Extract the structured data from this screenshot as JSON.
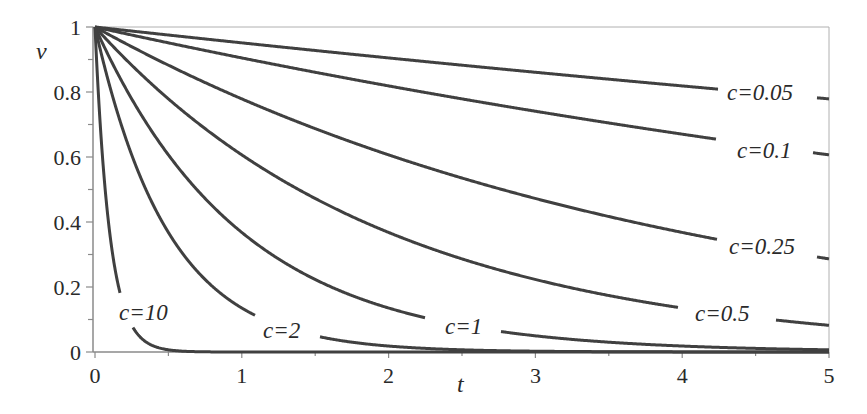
{
  "chart_data": {
    "type": "line",
    "title": "",
    "xlabel": "t",
    "ylabel": "v",
    "xlim": [
      0,
      5
    ],
    "ylim": [
      0,
      1
    ],
    "x_ticks": [
      "0",
      "1",
      "2",
      "3",
      "4",
      "5"
    ],
    "y_ticks": [
      "0",
      "0.2",
      "0.4",
      "0.6",
      "0.8",
      "1"
    ],
    "grid": false,
    "legend": "inline labels on curves",
    "function": "v = exp(-c t)",
    "series": [
      {
        "name": "c=0.05",
        "c": 0.05,
        "x": [
          0,
          1,
          2,
          3,
          4,
          5
        ],
        "values": [
          1.0,
          0.951,
          0.905,
          0.861,
          0.819,
          0.779
        ]
      },
      {
        "name": "c=0.1",
        "c": 0.1,
        "x": [
          0,
          1,
          2,
          3,
          4,
          5
        ],
        "values": [
          1.0,
          0.905,
          0.819,
          0.741,
          0.67,
          0.607
        ]
      },
      {
        "name": "c=0.25",
        "c": 0.25,
        "x": [
          0,
          1,
          2,
          3,
          4,
          5
        ],
        "values": [
          1.0,
          0.779,
          0.607,
          0.472,
          0.368,
          0.287
        ]
      },
      {
        "name": "c=0.5",
        "c": 0.5,
        "x": [
          0,
          1,
          2,
          3,
          4,
          5
        ],
        "values": [
          1.0,
          0.607,
          0.368,
          0.223,
          0.135,
          0.082
        ]
      },
      {
        "name": "c=1",
        "c": 1,
        "x": [
          0,
          1,
          2,
          3,
          4,
          5
        ],
        "values": [
          1.0,
          0.368,
          0.135,
          0.05,
          0.018,
          0.007
        ]
      },
      {
        "name": "c=2",
        "c": 2,
        "x": [
          0,
          1,
          2,
          3,
          4,
          5
        ],
        "values": [
          1.0,
          0.135,
          0.018,
          0.002,
          0.0003,
          5e-05
        ]
      },
      {
        "name": "c=10",
        "c": 10,
        "x": [
          0,
          0.1,
          0.2,
          0.3,
          0.5,
          1
        ],
        "values": [
          1.0,
          0.368,
          0.135,
          0.05,
          0.007,
          5e-05
        ]
      }
    ]
  },
  "labels": {
    "c005": "c=0.05",
    "c01": "c=0.1",
    "c025": "c=0.25",
    "c05": "c=0.5",
    "c1": "c=1",
    "c2": "c=2",
    "c10": "c=10"
  },
  "colors": {
    "curve": "#404040",
    "axis": "#8a8a8a",
    "text": "#2a2a2a"
  }
}
